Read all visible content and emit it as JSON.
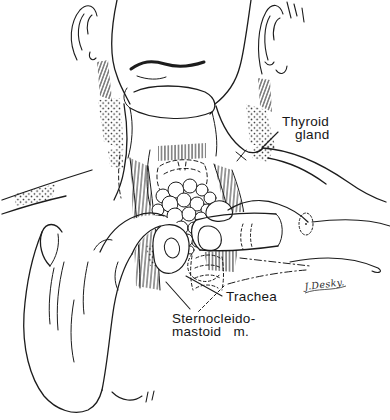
{
  "meta": {
    "background_color": "#ffffff",
    "ink_color": "#1c1c1c",
    "figure_type": "anatomical-line-illustration"
  },
  "labels": {
    "thyroid_gland": {
      "line1": "Thyroid",
      "line2": "gland"
    },
    "trachea": {
      "text": "Trachea"
    },
    "sternocleidomastoid": {
      "line1": "Sternocleido-",
      "line2": "mastoid   m."
    }
  },
  "signature": {
    "text": "J.Desky."
  }
}
